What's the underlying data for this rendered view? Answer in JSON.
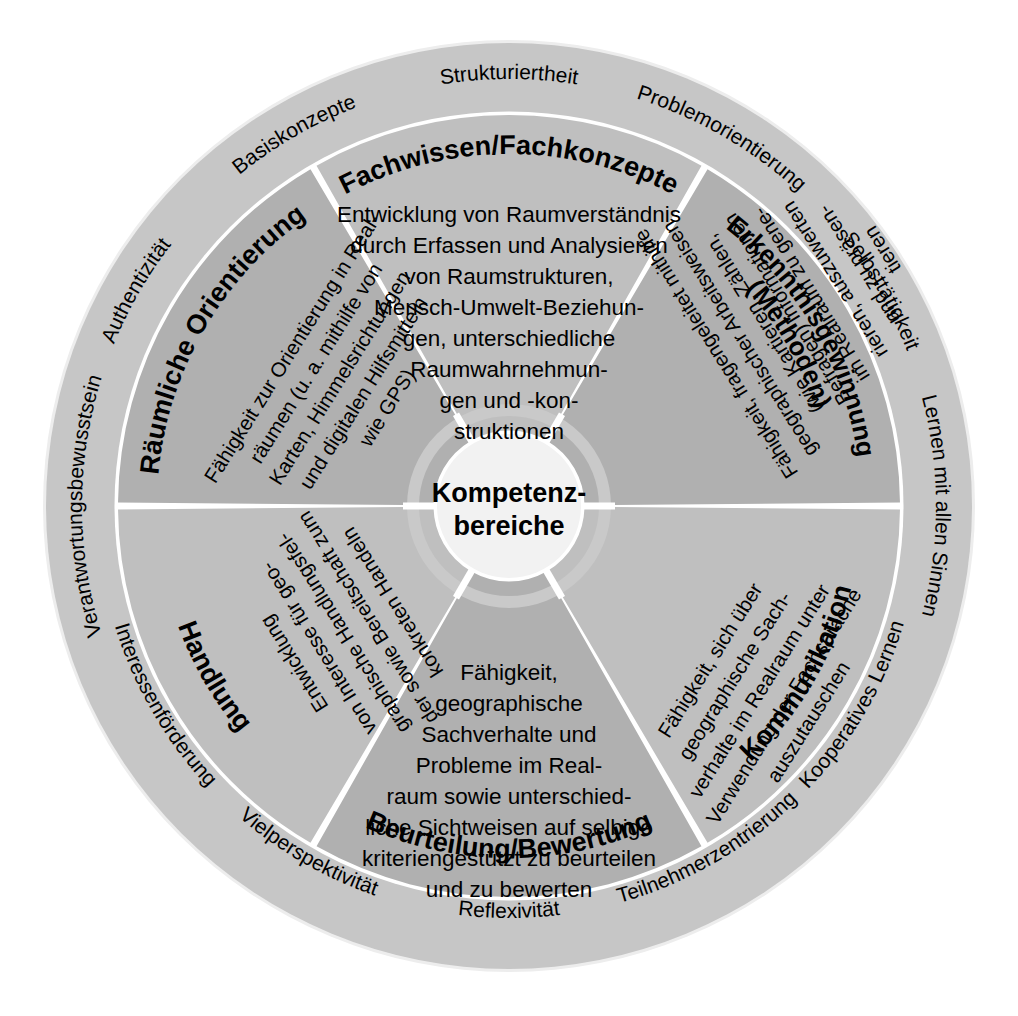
{
  "diagram": {
    "center": {
      "line1": "Kompetenz-",
      "line2": "bereiche"
    },
    "colors": {
      "background": "#ffffff",
      "outer_ring": "#c6c6c6",
      "segment_light": "#bfbfbf",
      "segment_dark": "#b0b0b0",
      "divider": "#ffffff",
      "center_fill": "#f2f2f2",
      "text": "#000000"
    },
    "segments": [
      {
        "id": "fachwissen",
        "title": "Fachwissen/Fachkonzepte",
        "description_lines": [
          "Entwicklung von Raumverständnis",
          "durch Erfassen und Analysieren",
          "von Raumstrukturen,",
          "Mensch-Umwelt-Beziehun-",
          "gen, unterschiedliche",
          "Raumwahrnehmun-",
          "gen und -kon-",
          "struktionen"
        ]
      },
      {
        "id": "erkenntnisgewinnung",
        "title": "Erkenntnisgewinnung",
        "title2": "(Methoden)",
        "description_lines": [
          "Fähigkeit, fragengeleitet mithilfe",
          "geographischer Arbeitsweisen",
          "(wie Kartieren, Zählen,",
          "Befragen) Informationen",
          "im Realraum zu gene-",
          "rieren, auszuwerten",
          "und zu präsen-",
          "tieren"
        ]
      },
      {
        "id": "kommunikation",
        "title": "Kommunikation",
        "description_lines": [
          "Fähigkeit, sich über",
          "geographische Sach-",
          "verhalte im Realraum unter",
          "Verwendung der Fachsprache",
          "auszutauschen"
        ]
      },
      {
        "id": "beurteilung",
        "title": "Beurteilung/Bewertung",
        "description_lines": [
          "Fähigkeit,",
          "geographische",
          "Sachverhalte und",
          "Probleme im Real-",
          "raum sowie unterschied-",
          "liche Sichtweisen auf selbige",
          "kriteriengestützt zu beurteilen",
          "und zu bewerten"
        ]
      },
      {
        "id": "handlung",
        "title": "Handlung",
        "description_lines": [
          "Entwicklung",
          "von Interesse für geo-",
          "graphische Handlungsfel-",
          "der sowie Bereitschaft zum",
          "konkreten Handeln"
        ]
      },
      {
        "id": "raeumliche-orientierung",
        "title": "Räumliche Orientierung",
        "description_lines": [
          "Fähigkeit zur Orientierung in Real-",
          "räumen (u. a. mithilfe von",
          "Karten, Himmelsrichtungen",
          "und digitalen Hilfsmitteln",
          "wie GPS)"
        ]
      }
    ],
    "ring_labels": [
      {
        "id": "strukturiertheit",
        "text": "Strukturiertheit"
      },
      {
        "id": "problemorientierung",
        "text": "Problemorientierung"
      },
      {
        "id": "selbsttaetigkeit",
        "text": "Selbsttätigkeit"
      },
      {
        "id": "lernen-mit-allen-sinnen",
        "text": "Lernen mit allen Sinnen"
      },
      {
        "id": "kooperatives-lernen",
        "text": "Kooperatives Lernen"
      },
      {
        "id": "teilnehmerzentrierung",
        "text": "Teilnehmerzentrierung"
      },
      {
        "id": "reflexivitaet",
        "text": "Reflexivität"
      },
      {
        "id": "vielperspektivitaet",
        "text": "Vielperspektivität"
      },
      {
        "id": "interessenfoerderung",
        "text": "Interessenförderung"
      },
      {
        "id": "verantwortungsbewusstsein",
        "text": "Verantwortungsbewusstsein"
      },
      {
        "id": "authentizitaet",
        "text": "Authentizität"
      },
      {
        "id": "basiskonzepte",
        "text": "Basiskonzepte"
      }
    ]
  }
}
